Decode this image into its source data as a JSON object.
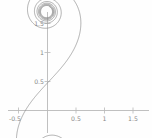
{
  "figure": {
    "background_color": "#fefefe",
    "curve_color": "#8f8f8f",
    "axis_color": "#b9b9b9",
    "label_color": "#8a8a8a"
  },
  "chart_data": {
    "type": "line",
    "title": "",
    "subtitle": "",
    "xlabel": "",
    "ylabel": "",
    "xlim": [
      -0.62,
      1.72
    ],
    "ylim": [
      -0.28,
      1.72
    ],
    "grid": false,
    "legend": null,
    "xticks": [
      -0.5,
      0.5,
      1,
      1.5
    ],
    "xtick_labels": [
      "-0.5",
      "0.5",
      "1",
      "1.5"
    ],
    "yticks": [
      0.5,
      1,
      1.5
    ],
    "ytick_labels": [
      "0.5",
      "1",
      "1.5"
    ],
    "annotations": [],
    "series": [
      {
        "name": "double-spiral",
        "style": "solid",
        "color": "#8f8f8f",
        "spiral_centers": [
          {
            "x": 0.0,
            "y": -0.03
          },
          {
            "x": 1.18,
            "y": 1.22
          }
        ],
        "inflection_point": {
          "x": 0.02,
          "y": 0.5
        },
        "points_note": "parametric clothoid sampled from t=-5.2 to t=5.2"
      }
    ]
  }
}
